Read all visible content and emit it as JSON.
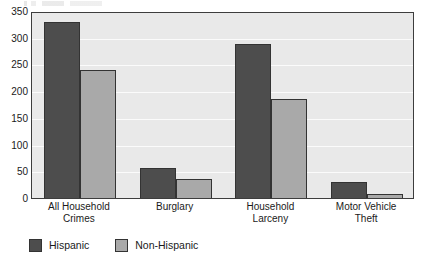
{
  "chart_data": {
    "type": "bar",
    "title": "",
    "xlabel": "",
    "ylabel": "",
    "ylim": [
      0,
      350
    ],
    "ytick_step": 50,
    "yticks": [
      "350",
      "300",
      "250",
      "200",
      "150",
      "100",
      "50",
      "0"
    ],
    "grid": true,
    "legend_position": "bottom-left",
    "categories": [
      "All Household\nCrimes",
      "Burglary",
      "Household\nLarceny",
      "Motor Vehicle\nTheft"
    ],
    "category_lines": [
      [
        "All Household",
        "Crimes"
      ],
      [
        "Burglary",
        ""
      ],
      [
        "Household",
        "Larceny"
      ],
      [
        "Motor Vehicle",
        "Theft"
      ]
    ],
    "series": [
      {
        "name": "Hispanic",
        "color": "#4d4d4d",
        "values": [
          330,
          57,
          288,
          30
        ]
      },
      {
        "name": "Non-Hispanic",
        "color": "#a9a9a9",
        "values": [
          240,
          35,
          186,
          8
        ]
      }
    ]
  },
  "legend": {
    "items": [
      {
        "label": "Hispanic",
        "color": "#4d4d4d"
      },
      {
        "label": "Non-Hispanic",
        "color": "#a9a9a9"
      }
    ]
  },
  "colors": {
    "plot_background": "#e9e9e9",
    "gridline": "#fbfbfb",
    "axis_border": "#3d3d3d",
    "bar_outline": "#333333",
    "text": "#1a1a1a",
    "page_background": "#ffffff"
  }
}
